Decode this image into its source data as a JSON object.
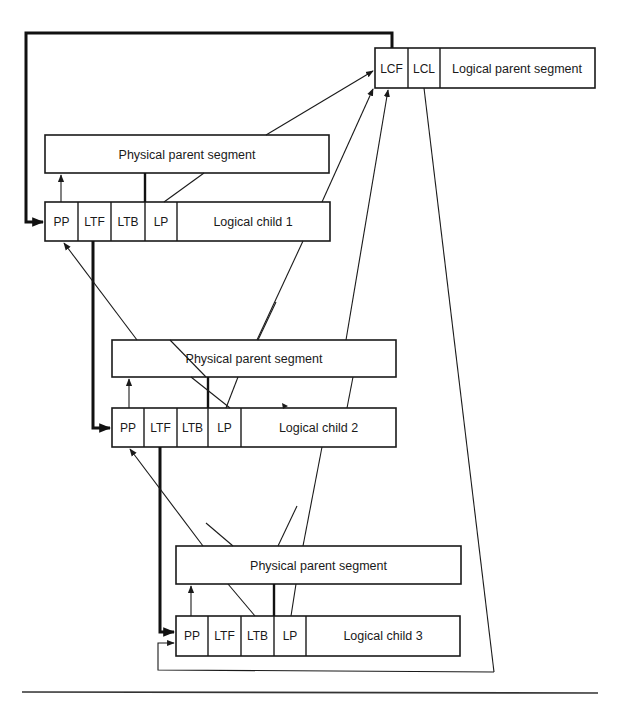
{
  "diagram": {
    "logical_parent": {
      "cells": [
        "LCF",
        "LCL"
      ],
      "label": "Logical parent segment"
    },
    "groups": [
      {
        "physical_parent_label": "Physical parent segment",
        "child": {
          "cells": [
            "PP",
            "LTF",
            "LTB",
            "LP"
          ],
          "label": "Logical child 1"
        }
      },
      {
        "physical_parent_label": "Physical parent segment",
        "child": {
          "cells": [
            "PP",
            "LTF",
            "LTB",
            "LP"
          ],
          "label": "Logical child 2"
        }
      },
      {
        "physical_parent_label": "Physical parent segment",
        "child": {
          "cells": [
            "PP",
            "LTF",
            "LTB",
            "LP"
          ],
          "label": "Logical child 3"
        }
      }
    ],
    "colors": {
      "ink": "#1a1a1a",
      "background": "#ffffff"
    }
  }
}
